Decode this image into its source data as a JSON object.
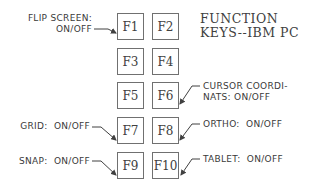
{
  "title": {
    "line1": "FUNCTION",
    "line2": "KEYS--IBM PC"
  },
  "keys": [
    {
      "label": "F1"
    },
    {
      "label": "F2"
    },
    {
      "label": "F3"
    },
    {
      "label": "F4"
    },
    {
      "label": "F5"
    },
    {
      "label": "F6"
    },
    {
      "label": "F7"
    },
    {
      "label": "F8"
    },
    {
      "label": "F9"
    },
    {
      "label": "F10"
    }
  ],
  "annotations": {
    "f1": {
      "line1": "FLIP SCREEN:",
      "line2": "ON/OFF"
    },
    "f6": {
      "line1": "CURSOR COORDI-",
      "line2": "NATS: ON/OFF"
    },
    "f7": {
      "text": "GRID:  ON/OFF"
    },
    "f8": {
      "text": "ORTHO:  ON/OFF"
    },
    "f9": {
      "text": "SNAP:  ON/OFF"
    },
    "f10": {
      "text": "TABLET:  ON/OFF"
    }
  },
  "colors": {
    "line": "#404040",
    "box_border": "#707070",
    "text": "#3a3a3a"
  }
}
